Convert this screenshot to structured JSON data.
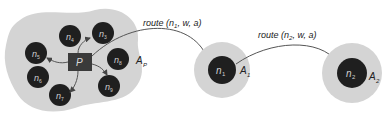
{
  "colors": {
    "region": "#d4d4d4",
    "node": "#1f1f1f",
    "node_text": "#cfcfcf",
    "proc": "#3a3a3a",
    "proc_text": "#d8d8d8",
    "arrow": "#555555",
    "label": "#222222"
  },
  "blob": {
    "label_main": "A",
    "label_sub": "P",
    "process": "P",
    "nodes": [
      {
        "id": "n3",
        "text": "n",
        "sub": "3"
      },
      {
        "id": "n4",
        "text": "n",
        "sub": "4"
      },
      {
        "id": "n5",
        "text": "n",
        "sub": "5"
      },
      {
        "id": "n6",
        "text": "n",
        "sub": "6"
      },
      {
        "id": "n7",
        "text": "n",
        "sub": "7"
      },
      {
        "id": "n8",
        "text": "n",
        "sub": "8"
      },
      {
        "id": "n9",
        "text": "n",
        "sub": "9"
      }
    ]
  },
  "target1": {
    "node_text": "n",
    "node_sub": "1",
    "area_main": "A",
    "area_sub": "1"
  },
  "target2": {
    "node_text": "n",
    "node_sub": "2",
    "area_main": "A",
    "area_sub": "2"
  },
  "routes": [
    {
      "prefix": "route (",
      "n": "n",
      "sub": "1",
      "suffix": ", w, a)"
    },
    {
      "prefix": "route (",
      "n": "n",
      "sub": "2",
      "suffix": ", w, a)"
    }
  ]
}
